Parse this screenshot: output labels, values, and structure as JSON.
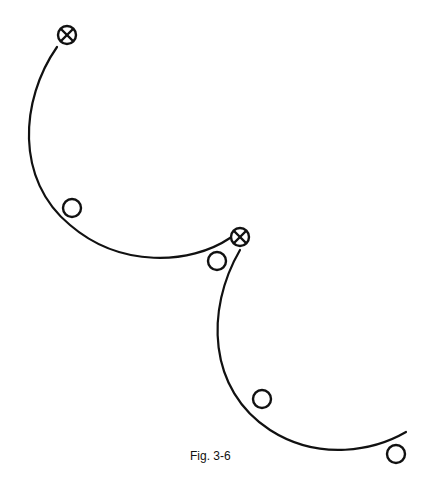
{
  "figure": {
    "caption": "Fig. 3-6",
    "stroke_color": "#111111",
    "arcs": [
      {
        "id": "arc-1",
        "path": "M57,47 C20,100 15,180 70,225 C120,268 190,265 230,238"
      },
      {
        "id": "arc-2",
        "path": "M240,250 C205,310 208,390 270,430 C320,462 375,450 406,432"
      }
    ],
    "crossed_circles": [
      {
        "cx": 67,
        "cy": 35
      },
      {
        "cx": 240,
        "cy": 237
      }
    ],
    "open_circles": [
      {
        "cx": 72,
        "cy": 208
      },
      {
        "cx": 217,
        "cy": 261
      },
      {
        "cx": 262,
        "cy": 399
      },
      {
        "cx": 396,
        "cy": 454
      }
    ]
  }
}
